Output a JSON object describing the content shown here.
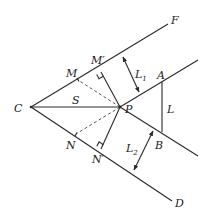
{
  "diagram": {
    "type": "geometry",
    "points": {
      "C": {
        "label": "C",
        "x": 31,
        "y": 107
      },
      "P": {
        "label": "P",
        "x": 120,
        "y": 107
      },
      "F": {
        "label": "F",
        "x": 168,
        "y": 24
      },
      "D": {
        "label": "D",
        "x": 172,
        "y": 200
      },
      "M": {
        "label": "M",
        "x": 78,
        "y": 80
      },
      "M_prime": {
        "label": "M′",
        "x": 101,
        "y": 72
      },
      "N": {
        "label": "N",
        "x": 76,
        "y": 134
      },
      "N_prime": {
        "label": "N′",
        "x": 101,
        "y": 149
      },
      "A": {
        "label": "A",
        "x": 162,
        "y": 82
      },
      "B": {
        "label": "B",
        "x": 162,
        "y": 132
      }
    },
    "labels": {
      "C": "C",
      "S": "S",
      "P": "P",
      "F": "F",
      "D": "D",
      "M": "M",
      "M_prime": "M′",
      "N": "N",
      "N_prime": "N′",
      "A": "A",
      "B": "B",
      "L": "L",
      "L1_main": "L",
      "L1_sub": "1",
      "L2_main": "L",
      "L2_sub": "2"
    },
    "segments": [
      {
        "name": "CF",
        "style": "solid"
      },
      {
        "name": "CD",
        "style": "solid"
      },
      {
        "name": "CP",
        "style": "solid",
        "label": "S"
      },
      {
        "name": "P-upper-ray",
        "style": "solid",
        "parallel_to": "CF"
      },
      {
        "name": "P-lower-ray",
        "style": "solid",
        "parallel_to": "CD"
      },
      {
        "name": "PM'",
        "style": "solid",
        "perpendicular_to": "CF"
      },
      {
        "name": "PN'",
        "style": "solid",
        "perpendicular_to": "CD"
      },
      {
        "name": "PM",
        "style": "dashed"
      },
      {
        "name": "PN",
        "style": "dashed"
      },
      {
        "name": "AB",
        "style": "solid",
        "label": "L"
      }
    ],
    "dimensions": [
      {
        "name": "L1",
        "between": [
          "CF",
          "P-upper-ray"
        ]
      },
      {
        "name": "L2",
        "between": [
          "P-lower-ray",
          "CD"
        ]
      }
    ],
    "colors": {
      "stroke": "#2a2a2a",
      "background": "#ffffff"
    }
  }
}
